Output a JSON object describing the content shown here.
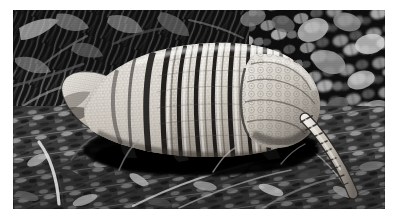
{
  "page": {
    "background_color": "#ffffff",
    "width": 399,
    "height": 220
  },
  "photo": {
    "kind": "photograph",
    "color_mode": "black-and-white",
    "frame": {
      "x": 13,
      "y": 10,
      "width": 372,
      "height": 199
    },
    "subject": "armadillo",
    "subject_description": "A single armadillo walking left-to-right in profile across leaf litter, facing left.",
    "scene": "dense low vegetation and dry leaf litter on the ground, dark shaded background",
    "lighting": "bright direct sunlight on the animal's banded shell, deep black shadows behind and beneath it",
    "caption": "",
    "palette": {
      "background_dark": "#080808",
      "foliage_dark": "#1c1c1c",
      "foliage_mid": "#555555",
      "foliage_light": "#bdbdbd",
      "litter_mid": "#6e6e6e",
      "shell_highlight": "#f2f0ec",
      "shell_light": "#ddd9d2",
      "shell_mid": "#a9a49c",
      "shell_groove": "#1a1a1a",
      "shadow_black": "#050505",
      "white_border": "#ffffff"
    },
    "animal": {
      "name": "armadillo",
      "orientation": "facing left",
      "visible_parts": [
        "head and pointed snout",
        "ear",
        "banded carapace with movable bands",
        "scapular (shoulder) shield",
        "pelvic (rump) shield with rosette scutes",
        "foreleg in shadow",
        "hind leg in shadow",
        "long tapering ringed tail"
      ],
      "band_count": 9,
      "bbox": {
        "x": 60,
        "y": 34,
        "width": 250,
        "height": 110
      },
      "tail": {
        "from_x": 292,
        "from_y": 108,
        "to_x": 348,
        "to_y": 178
      }
    }
  }
}
